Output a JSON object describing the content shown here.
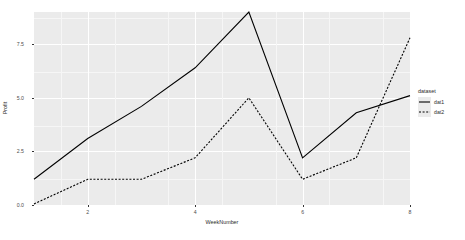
{
  "chart_data": {
    "type": "line",
    "title": "",
    "xlabel": "WeekNumber",
    "ylabel": "Profit",
    "legend_title": "dataset",
    "legend_position": "right",
    "grid": true,
    "xlim": [
      1,
      8
    ],
    "ylim": [
      0.0,
      9.0
    ],
    "x_ticks": [
      2,
      4,
      6,
      8
    ],
    "x_tick_labels": [
      "2",
      "4",
      "6",
      "8"
    ],
    "y_ticks": [
      0.0,
      2.5,
      5.0,
      7.5
    ],
    "y_tick_labels": [
      "0.0",
      "2.5",
      "5.0",
      "7.5"
    ],
    "x": [
      1,
      2,
      3,
      4,
      5,
      6,
      7,
      8
    ],
    "series": [
      {
        "name": "dat1",
        "style": "solid",
        "color": "#000000",
        "values": [
          1.2,
          3.1,
          4.6,
          6.4,
          9.0,
          2.2,
          4.3,
          5.1
        ]
      },
      {
        "name": "dat2",
        "style": "dashed",
        "color": "#000000",
        "values": [
          0.05,
          1.2,
          1.2,
          2.2,
          5.0,
          1.2,
          2.2,
          7.8
        ]
      }
    ]
  },
  "axes": {
    "y_labels": [
      "7.5",
      "5.0",
      "2.5",
      "0.0"
    ],
    "x_labels": [
      "2",
      "4",
      "6",
      "8"
    ],
    "x_title": "WeekNumber",
    "y_title": "Profit"
  },
  "legend": {
    "title": "dataset",
    "items": [
      {
        "label": "dat1",
        "style": "solid"
      },
      {
        "label": "dat2",
        "style": "dashed"
      }
    ]
  },
  "colors": {
    "panel": "#ebebeb",
    "grid_major": "#ffffff",
    "grid_minor": "#f6f6f6",
    "line": "#000000",
    "text": "#2b2b2b",
    "tick_text": "#4d4d4d",
    "background": "#ffffff"
  }
}
